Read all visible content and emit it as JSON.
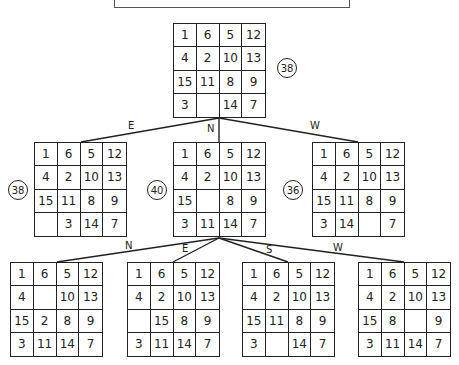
{
  "root": {
    "cells": [
      [
        "1",
        "6",
        "5",
        "12"
      ],
      [
        "4",
        "2",
        "10",
        "13"
      ],
      [
        "15",
        "11",
        "8",
        "9"
      ],
      [
        "3",
        "",
        "14",
        "7"
      ]
    ],
    "score": "38"
  },
  "level2": [
    {
      "move": "E",
      "score": "38",
      "cells": [
        [
          "1",
          "6",
          "5",
          "12"
        ],
        [
          "4",
          "2",
          "10",
          "13"
        ],
        [
          "15",
          "11",
          "8",
          "9"
        ],
        [
          "",
          "3",
          "14",
          "7"
        ]
      ]
    },
    {
      "move": "N",
      "score": "40",
      "cells": [
        [
          "1",
          "6",
          "5",
          "12"
        ],
        [
          "4",
          "2",
          "10",
          "13"
        ],
        [
          "15",
          "",
          "8",
          "9"
        ],
        [
          "3",
          "11",
          "14",
          "7"
        ]
      ]
    },
    {
      "move": "W",
      "score": "36",
      "cells": [
        [
          "1",
          "6",
          "5",
          "12"
        ],
        [
          "4",
          "2",
          "10",
          "13"
        ],
        [
          "15",
          "11",
          "8",
          "9"
        ],
        [
          "3",
          "14",
          "",
          "7"
        ]
      ]
    }
  ],
  "level3": [
    {
      "move": "N",
      "cells": [
        [
          "1",
          "6",
          "5",
          "12"
        ],
        [
          "4",
          "",
          "10",
          "13"
        ],
        [
          "15",
          "2",
          "8",
          "9"
        ],
        [
          "3",
          "11",
          "14",
          "7"
        ]
      ]
    },
    {
      "move": "E",
      "cells": [
        [
          "1",
          "6",
          "5",
          "12"
        ],
        [
          "4",
          "2",
          "10",
          "13"
        ],
        [
          "",
          "15",
          "8",
          "9"
        ],
        [
          "3",
          "11",
          "14",
          "7"
        ]
      ]
    },
    {
      "move": "S",
      "cells": [
        [
          "1",
          "6",
          "5",
          "12"
        ],
        [
          "4",
          "2",
          "10",
          "13"
        ],
        [
          "15",
          "11",
          "8",
          "9"
        ],
        [
          "3",
          "",
          "14",
          "7"
        ]
      ]
    },
    {
      "move": "W",
      "cells": [
        [
          "1",
          "6",
          "5",
          "12"
        ],
        [
          "4",
          "2",
          "10",
          "13"
        ],
        [
          "15",
          "8",
          "",
          "9"
        ],
        [
          "3",
          "11",
          "14",
          "7"
        ]
      ]
    }
  ]
}
